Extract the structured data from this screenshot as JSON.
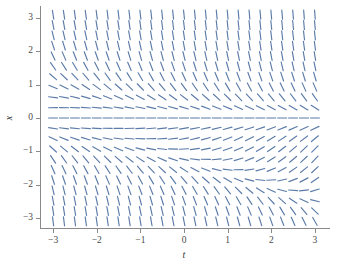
{
  "figure": {
    "background": "#ffffff",
    "caption": ""
  },
  "chart_data": {
    "type": "scatter",
    "subtype": "slope-field",
    "title": "",
    "xlabel": "t",
    "ylabel": "x",
    "xlim": [
      -3.3,
      3.3
    ],
    "ylim": [
      -3.3,
      3.3
    ],
    "grid": false,
    "legend": null,
    "legend_position": "none",
    "xticks": [
      -3,
      -2,
      -1,
      0,
      1,
      2,
      3
    ],
    "xticklabels": [
      "−3",
      "−2",
      "−1",
      "0",
      "1",
      "2",
      "3"
    ],
    "yticks": [
      -3,
      -2,
      -1,
      0,
      1,
      2,
      3
    ],
    "yticklabels": [
      "−3",
      "−2",
      "−1",
      "0",
      "1",
      "2",
      "3"
    ],
    "stroke_color": "#5b7ba8",
    "stroke_width": 1.15,
    "dash_length_px": 9,
    "grid_nx": 25,
    "grid_ny": 21,
    "x_start": -3.0,
    "x_step": 0.25,
    "y_start": -3.1,
    "y_step": 0.31,
    "slope_formula": "dx/dt = -x*(x+1) - 0.45*t*x",
    "equilibria": [
      {
        "t": 0,
        "x": 0,
        "kind": "saddle"
      },
      {
        "t": 0,
        "x": -1,
        "kind": "center"
      }
    ]
  },
  "axes": {
    "x_axis_name": "t",
    "y_axis_name": "x"
  }
}
